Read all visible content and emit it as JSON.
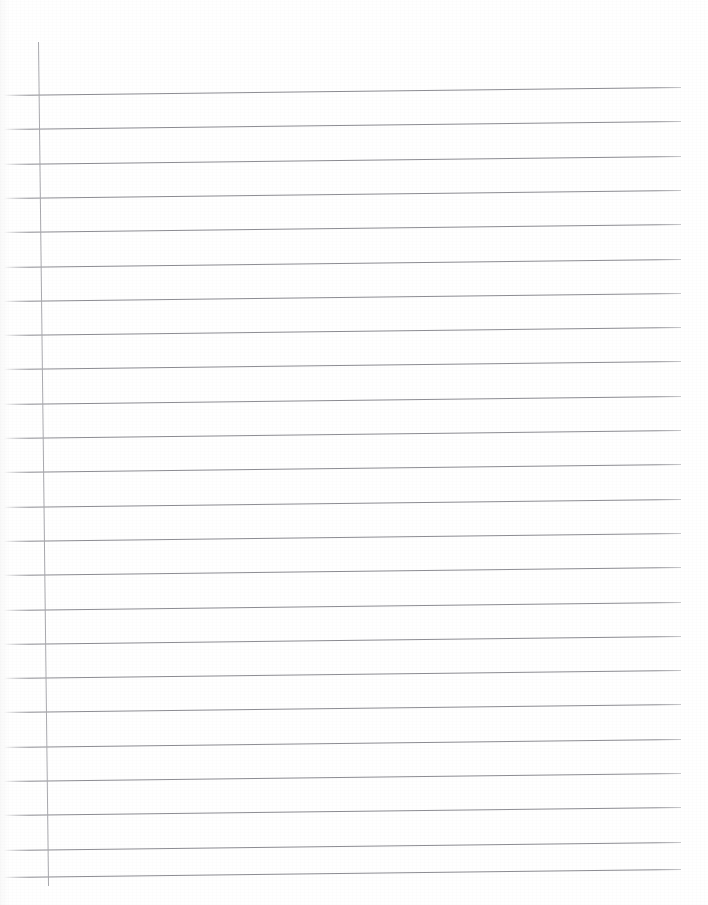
{
  "document": {
    "kind": "lined-notebook-paper",
    "title": "Blank ruled notebook page",
    "page_width": 708,
    "page_height": 905,
    "background_color": "#ffffff",
    "written_content": "",
    "text_content_note": "The page is blank — no handwriting, printed text, headings, numbers or labels are visible anywhere on the sheet."
  },
  "ruling": {
    "rule_color": "#8d8d93",
    "rule_thickness_px": 1,
    "rule_left_x": 4,
    "rule_right_x": 681,
    "rule_count": 24,
    "rule_spacing_px": 34.3,
    "first_rule_y": 95,
    "skew_degrees": -0.68,
    "skew_note": "Lines rise slightly toward the right edge, a scanning skew of roughly 8 px rise across the full 708 px width.",
    "line_y_positions": [
      95,
      129.3,
      163.6,
      197.9,
      232.2,
      266.5,
      300.8,
      335.1,
      369.4,
      403.7,
      438,
      472.3,
      506.6,
      540.9,
      575.2,
      609.5,
      643.8,
      678.1,
      712.4,
      746.7,
      781,
      815.3,
      849.6,
      877
    ]
  },
  "margin_rule": {
    "name": "vertical-margin-line",
    "color": "#a9a9ae",
    "thickness_px": 1,
    "x": 38,
    "top_y": 42,
    "bottom_y": 886
  }
}
